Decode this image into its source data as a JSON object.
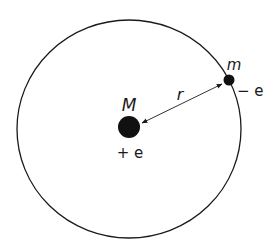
{
  "diagram": {
    "type": "bohr-atom-orbit",
    "nucleus": {
      "mass_label": "M",
      "charge_label": "+ e"
    },
    "electron": {
      "mass_label": "m",
      "charge_label": "− e"
    },
    "radius_label": "r",
    "colors": {
      "stroke": "#1a1a1a",
      "fill": "#111111",
      "background": "#ffffff"
    }
  }
}
